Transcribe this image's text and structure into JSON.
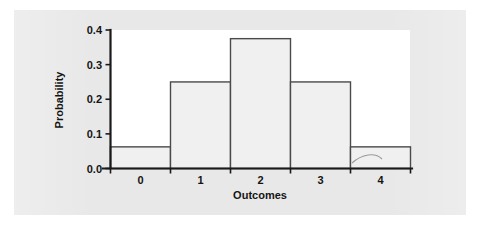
{
  "figure": {
    "background_color": "#e8e8e8",
    "plot_background_color": "#ffffff",
    "bar_fill_color": "#f0f0f0",
    "bar_stroke_color": "#4a4a4a",
    "axis_color": "#1a1a1a"
  },
  "chart_data": {
    "type": "bar",
    "title": "",
    "subtitle": "",
    "categories": [
      "0",
      "1",
      "2",
      "3",
      "4"
    ],
    "values": [
      0.0625,
      0.25,
      0.375,
      0.25,
      0.0625
    ],
    "xlabel": "Outcomes",
    "ylabel": "Probability",
    "xlim": [
      -0.5,
      4.5
    ],
    "ylim": [
      0.0,
      0.4
    ],
    "ytick_labels": [
      "0.0",
      "0.1",
      "0.2",
      "0.3",
      "0.4"
    ],
    "ytick_values": [
      0.0,
      0.1,
      0.2,
      0.3,
      0.4
    ],
    "xtick_labels": [
      "0",
      "1",
      "2",
      "3",
      "4"
    ],
    "grid": false,
    "legend": null,
    "legend_position": "none",
    "annotations": []
  }
}
